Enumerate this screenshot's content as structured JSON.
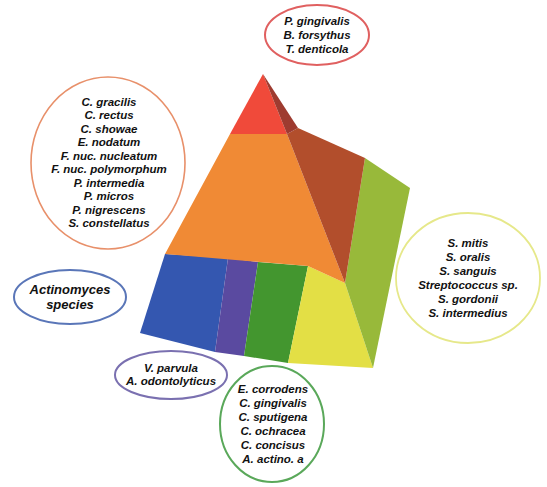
{
  "figure": {
    "type": "microbial-complex-pyramid",
    "colors": {
      "red": "#f04a3a",
      "red_side": "#9e3b30",
      "orange": "#f08a35",
      "orange_side": "#b24e2c",
      "yellow": "#e3df45",
      "yellow_green_side": "#98b93a",
      "green": "#43962f",
      "purple": "#5a4aa0",
      "blue": "#3457b0"
    }
  },
  "complexes": {
    "red": {
      "color": "#e06060",
      "species": [
        "P. gingivalis",
        "B. forsythus",
        "T. denticola"
      ]
    },
    "orange": {
      "color": "#e8906a",
      "species": [
        "C. gracilis",
        "C. rectus",
        "C. showae",
        "E. nodatum",
        "F. nuc. nucleatum",
        "F. nuc. polymorphum",
        "P. intermedia",
        "P. micros",
        "P. nigrescens",
        "S. constellatus"
      ]
    },
    "yellow": {
      "color": "#e6e88a",
      "species": [
        "S. mitis",
        "S. oralis",
        "S. sanguis",
        "Streptococcus sp.",
        "S. gordonii",
        "S. intermedius"
      ]
    },
    "actinomyces": {
      "color": "#5a76b8",
      "species": [
        "Actinomyces",
        "species"
      ]
    },
    "purple": {
      "color": "#7a70b0",
      "species": [
        "V. parvula",
        "A. odontolyticus"
      ]
    },
    "green": {
      "color": "#5aa85a",
      "species": [
        "E. corrodens",
        "C. gingivalis",
        "C. sputigena",
        "C. ochracea",
        "C. concisus",
        "A. actino. a"
      ]
    }
  }
}
